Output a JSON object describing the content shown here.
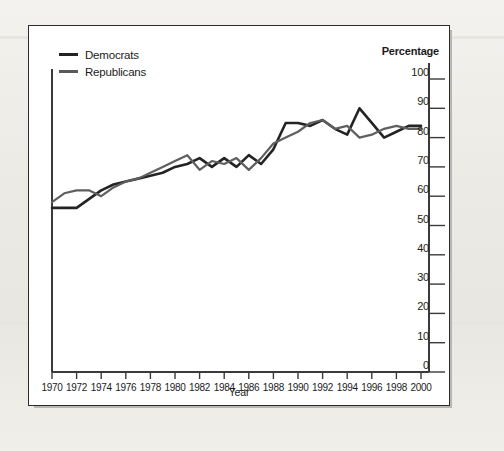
{
  "chart_data": {
    "type": "line",
    "title": "",
    "xlabel": "Year",
    "ylabel": "Percentage",
    "ylim": [
      0,
      100
    ],
    "xlim": [
      1970,
      2000
    ],
    "grid": false,
    "legend_position": "top-left",
    "y_axis_position": "right",
    "yticks": [
      100,
      90,
      80,
      70,
      60,
      50,
      40,
      30,
      20,
      10,
      0
    ],
    "xticks": [
      1970,
      1972,
      1974,
      1976,
      1978,
      1980,
      1982,
      1984,
      1986,
      1988,
      1990,
      1992,
      1994,
      1996,
      1998,
      2000
    ],
    "x": [
      1970,
      1971,
      1972,
      1973,
      1974,
      1975,
      1976,
      1977,
      1978,
      1979,
      1980,
      1981,
      1982,
      1983,
      1984,
      1985,
      1986,
      1987,
      1988,
      1989,
      1990,
      1991,
      1992,
      1993,
      1994,
      1995,
      1996,
      1997,
      1998,
      1999,
      2000
    ],
    "series": [
      {
        "name": "Democrats",
        "color": "#242424",
        "values": [
          56,
          56,
          56,
          59,
          62,
          64,
          65,
          66,
          67,
          68,
          70,
          71,
          73,
          70,
          73,
          70,
          74,
          71,
          76,
          85,
          85,
          84,
          86,
          83,
          81,
          90,
          85,
          80,
          82,
          84,
          84
        ]
      },
      {
        "name": "Republicans",
        "color": "#5f5f5f",
        "values": [
          58,
          61,
          62,
          62,
          60,
          63,
          65,
          66,
          68,
          70,
          72,
          74,
          69,
          72,
          71,
          73,
          69,
          73,
          78,
          80,
          82,
          85,
          86,
          83,
          84,
          80,
          81,
          83,
          84,
          83,
          83
        ]
      }
    ]
  },
  "legend": {
    "items": [
      {
        "label": "Democrats"
      },
      {
        "label": "Republicans"
      }
    ]
  },
  "axis": {
    "percentage_title": "Percentage",
    "year_title": "Year"
  }
}
